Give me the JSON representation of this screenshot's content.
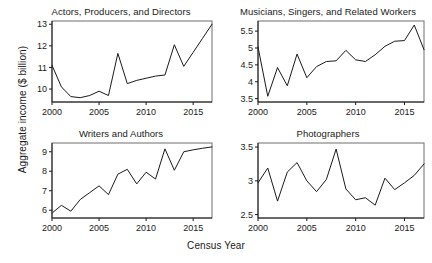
{
  "figure": {
    "xlabel": "Census Year",
    "ylabel": "Aggregate income ($ billion)",
    "line_color": "#1a1a1a",
    "frame_color": "#6e6e6e",
    "background": "#ffffff"
  },
  "panels": [
    {
      "id": "actors",
      "title": "Actors, Producers, and Directors",
      "yticks": [
        "10",
        "11",
        "12",
        "13"
      ],
      "xticks": [
        "2000",
        "2005",
        "2010",
        "2015"
      ]
    },
    {
      "id": "musicians",
      "title": "Musicians, Singers, and Related Workers",
      "yticks": [
        "3.5",
        "4",
        "4.5",
        "5",
        "5.5"
      ],
      "xticks": [
        "2000",
        "2005",
        "2010",
        "2015"
      ]
    },
    {
      "id": "writers",
      "title": "Writers and Authors",
      "yticks": [
        "6",
        "7",
        "8",
        "9"
      ],
      "xticks": [
        "2000",
        "2005",
        "2010",
        "2015"
      ]
    },
    {
      "id": "photographers",
      "title": "Photographers",
      "yticks": [
        "2.5",
        "3",
        "3.5"
      ],
      "xticks": [
        "2000",
        "2005",
        "2010",
        "2015"
      ]
    }
  ],
  "chart_data": [
    {
      "type": "line",
      "title": "Actors, Producers, and Directors",
      "xlabel": "Census Year",
      "ylabel": "Aggregate income ($ billion)",
      "x": [
        2000,
        2001,
        2002,
        2003,
        2004,
        2005,
        2006,
        2007,
        2008,
        2009,
        2010,
        2011,
        2012,
        2013,
        2014,
        2015,
        2016,
        2017
      ],
      "values": [
        11.1,
        10.1,
        9.65,
        9.6,
        9.7,
        9.9,
        9.7,
        11.65,
        10.25,
        10.4,
        10.5,
        10.6,
        10.65,
        12.05,
        11.05,
        11.7,
        12.35,
        13.0
      ],
      "xlim": [
        2000,
        2017
      ],
      "ylim": [
        9.4,
        13.15
      ],
      "ytick_values": [
        10,
        11,
        12,
        13
      ],
      "xtick_values": [
        2000,
        2005,
        2010,
        2015
      ],
      "grid": false,
      "legend": "none"
    },
    {
      "type": "line",
      "title": "Musicians, Singers, and Related Workers",
      "xlabel": "Census Year",
      "ylabel": "Aggregate income ($ billion)",
      "x": [
        2000,
        2001,
        2002,
        2003,
        2004,
        2005,
        2006,
        2007,
        2008,
        2009,
        2010,
        2011,
        2012,
        2013,
        2014,
        2015,
        2016,
        2017
      ],
      "values": [
        5.03,
        3.57,
        4.42,
        3.88,
        4.82,
        4.12,
        4.45,
        4.6,
        4.62,
        4.93,
        4.65,
        4.6,
        4.8,
        5.05,
        5.2,
        5.22,
        5.68,
        4.95
      ],
      "xlim": [
        2000,
        2017
      ],
      "ylim": [
        3.4,
        5.8
      ],
      "ytick_values": [
        3.5,
        4,
        4.5,
        5,
        5.5
      ],
      "xtick_values": [
        2000,
        2005,
        2010,
        2015
      ],
      "grid": false,
      "legend": "none"
    },
    {
      "type": "line",
      "title": "Writers and Authors",
      "xlabel": "Census Year",
      "ylabel": "Aggregate income ($ billion)",
      "x": [
        2000,
        2001,
        2002,
        2003,
        2004,
        2005,
        2006,
        2007,
        2008,
        2009,
        2010,
        2011,
        2012,
        2013,
        2014,
        2015,
        2016,
        2017
      ],
      "values": [
        5.85,
        6.25,
        5.95,
        6.55,
        6.9,
        7.25,
        6.8,
        7.85,
        8.1,
        7.35,
        7.95,
        7.6,
        9.15,
        8.05,
        9.0,
        9.1,
        9.18,
        9.25
      ],
      "xlim": [
        2000,
        2017
      ],
      "ylim": [
        5.6,
        9.45
      ],
      "ytick_values": [
        6,
        7,
        8,
        9
      ],
      "xtick_values": [
        2000,
        2005,
        2010,
        2015
      ],
      "grid": false,
      "legend": "none"
    },
    {
      "type": "line",
      "title": "Photographers",
      "xlabel": "Census Year",
      "ylabel": "Aggregate income ($ billion)",
      "x": [
        2000,
        2001,
        2002,
        2003,
        2004,
        2005,
        2006,
        2007,
        2008,
        2009,
        2010,
        2011,
        2012,
        2013,
        2014,
        2015,
        2016,
        2017
      ],
      "values": [
        2.97,
        3.19,
        2.7,
        3.13,
        3.27,
        3.0,
        2.84,
        3.02,
        3.47,
        2.88,
        2.72,
        2.75,
        2.64,
        3.04,
        2.87,
        2.97,
        3.08,
        3.25
      ],
      "xlim": [
        2000,
        2017
      ],
      "ylim": [
        2.45,
        3.56
      ],
      "ytick_values": [
        2.5,
        3,
        3.5
      ],
      "xtick_values": [
        2000,
        2005,
        2010,
        2015
      ],
      "grid": false,
      "legend": "none"
    }
  ]
}
